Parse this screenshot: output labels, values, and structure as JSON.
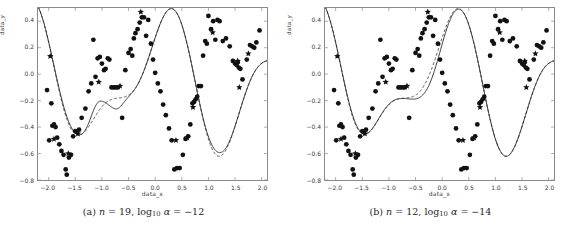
{
  "figure": {
    "background": "#ffffff",
    "marker_color": "#111111",
    "curve_color": "#333333"
  },
  "panels": [
    {
      "id": "a",
      "caption": {
        "tag": "(a)",
        "n_symbol": "n",
        "n_value": "= 19,",
        "log_base": "10",
        "log_symbol": "log",
        "alpha_symbol": "α",
        "alpha_value": "= −12",
        "full_text": "(a) n = 19, log10 α = −12"
      }
    },
    {
      "id": "b",
      "caption": {
        "tag": "(b)",
        "n_symbol": "n",
        "n_value": "= 12,",
        "log_base": "10",
        "log_symbol": "log",
        "alpha_symbol": "α",
        "alpha_value": "= −14",
        "full_text": "(b) n = 12, log10 α = −14"
      }
    }
  ],
  "chart_data": [
    {
      "type": "scatter",
      "panel": "a",
      "title": "",
      "xlabel": "data_x",
      "ylabel": "data_y",
      "xlim": [
        -2.2,
        2.1
      ],
      "ylim": [
        -0.8,
        0.5
      ],
      "xticks": [
        -2.0,
        -1.5,
        -1.0,
        -0.5,
        0.0,
        0.5,
        1.0,
        1.5,
        2.0
      ],
      "xticklabels": [
        "−2.0",
        "−1.5",
        "−1.0",
        "−0.5",
        "0.0",
        "0.5",
        "1.0",
        "1.5",
        "2.0"
      ],
      "yticks": [
        0.4,
        0.2,
        0.0,
        -0.2,
        -0.4,
        -0.6,
        -0.8
      ],
      "yticklabels": [
        "0.4",
        "0.2",
        "0.0",
        "−0.2",
        "−0.4",
        "−0.6",
        "−0.8"
      ],
      "grid": false,
      "legend": "none",
      "series": [
        {
          "name": "data points (circles)",
          "marker": "circle",
          "points": [
            [
              -2.03,
              -0.12
            ],
            [
              -1.99,
              -0.5
            ],
            [
              -1.95,
              -0.22
            ],
            [
              -1.93,
              -0.39
            ],
            [
              -1.9,
              -0.38
            ],
            [
              -1.87,
              -0.4
            ],
            [
              -1.84,
              -0.48
            ],
            [
              -1.8,
              -0.53
            ],
            [
              -1.76,
              -0.58
            ],
            [
              -1.72,
              -0.61
            ],
            [
              -1.68,
              -0.72
            ],
            [
              -1.66,
              -0.76
            ],
            [
              -1.62,
              -0.63
            ],
            [
              -1.58,
              -0.61
            ],
            [
              -1.54,
              -0.47
            ],
            [
              -1.5,
              -0.43
            ],
            [
              -1.47,
              -0.44
            ],
            [
              -1.43,
              -0.42
            ],
            [
              -1.38,
              -0.33
            ],
            [
              -1.31,
              -0.26
            ],
            [
              -1.25,
              -0.13
            ],
            [
              -1.2,
              -0.07
            ],
            [
              -1.16,
              0.26
            ],
            [
              -1.12,
              -0.02
            ],
            [
              -1.08,
              0.12
            ],
            [
              -1.04,
              0.13
            ],
            [
              -1.0,
              0.08
            ],
            [
              -0.96,
              0.03
            ],
            [
              -0.93,
              0.04
            ],
            [
              -0.89,
              0.12
            ],
            [
              -0.86,
              0.11
            ],
            [
              -0.82,
              -0.1
            ],
            [
              -0.78,
              -0.1
            ],
            [
              -0.74,
              -0.1
            ],
            [
              -0.7,
              -0.1
            ],
            [
              -0.62,
              -0.33
            ],
            [
              -0.56,
              0.03
            ],
            [
              -0.5,
              0.16
            ],
            [
              -0.46,
              0.19
            ],
            [
              -0.43,
              0.14
            ],
            [
              -0.4,
              0.27
            ],
            [
              -0.37,
              0.31
            ],
            [
              -0.33,
              0.34
            ],
            [
              -0.29,
              0.39
            ],
            [
              -0.25,
              0.43
            ],
            [
              -0.21,
              0.43
            ],
            [
              -0.17,
              0.29
            ],
            [
              -0.13,
              0.41
            ],
            [
              -0.08,
              0.23
            ],
            [
              -0.04,
              0.11
            ],
            [
              0.0,
              0.01
            ],
            [
              0.05,
              -0.07
            ],
            [
              0.1,
              -0.13
            ],
            [
              0.15,
              -0.23
            ],
            [
              0.2,
              -0.31
            ],
            [
              0.26,
              -0.41
            ],
            [
              0.31,
              -0.5
            ],
            [
              0.36,
              -0.72
            ],
            [
              0.41,
              -0.71
            ],
            [
              0.46,
              -0.71
            ],
            [
              0.52,
              -0.61
            ],
            [
              0.57,
              -0.49
            ],
            [
              0.62,
              -0.47
            ],
            [
              0.66,
              -0.38
            ],
            [
              0.7,
              -0.22
            ],
            [
              0.73,
              -0.21
            ],
            [
              0.76,
              -0.19
            ],
            [
              0.79,
              -0.17
            ],
            [
              0.82,
              -0.09
            ],
            [
              0.86,
              -0.09
            ],
            [
              0.9,
              0.14
            ],
            [
              0.94,
              0.25
            ],
            [
              0.97,
              0.23
            ],
            [
              1.0,
              0.44
            ],
            [
              1.05,
              0.34
            ],
            [
              1.09,
              0.4
            ],
            [
              1.13,
              0.26
            ],
            [
              1.17,
              0.41
            ],
            [
              1.21,
              0.4
            ],
            [
              1.27,
              0.25
            ],
            [
              1.33,
              0.27
            ],
            [
              1.4,
              0.21
            ],
            [
              1.46,
              0.1
            ],
            [
              1.5,
              0.08
            ],
            [
              1.53,
              0.07
            ],
            [
              1.55,
              0.09
            ],
            [
              1.57,
              0.05
            ],
            [
              1.6,
              0.04
            ],
            [
              1.64,
              -0.04
            ],
            [
              1.72,
              0.11
            ],
            [
              1.78,
              0.22
            ],
            [
              1.82,
              0.21
            ],
            [
              1.86,
              0.2
            ],
            [
              1.9,
              0.24
            ],
            [
              1.96,
              0.33
            ]
          ]
        },
        {
          "name": "outlier points (stars)",
          "marker": "star",
          "points": [
            [
              -1.97,
              0.135
            ],
            [
              -1.9,
              -0.49
            ],
            [
              -1.63,
              -0.6
            ],
            [
              -1.45,
              -0.45
            ],
            [
              -1.06,
              -0.06
            ],
            [
              -0.66,
              -0.09
            ],
            [
              -0.27,
              0.47
            ],
            [
              0.39,
              -0.5
            ],
            [
              0.6,
              -0.48
            ],
            [
              0.71,
              -0.25
            ],
            [
              1.08,
              0.315
            ],
            [
              1.55,
              0.1
            ],
            [
              1.58,
              -0.1
            ],
            [
              1.75,
              0.155
            ]
          ]
        },
        {
          "name": "fit-solid",
          "style": "solid",
          "description": "polynomial fit n=19 with extra oscillation near x=-1.1 and x=-0.6"
        },
        {
          "name": "fit-dashed",
          "style": "dashed",
          "description": "smoother reference fit"
        }
      ]
    },
    {
      "type": "scatter",
      "panel": "b",
      "title": "",
      "xlabel": "data_x",
      "ylabel": "data_y",
      "xlim": [
        -2.2,
        2.1
      ],
      "ylim": [
        -0.8,
        0.5
      ],
      "xticks": [
        -2.0,
        -1.5,
        -1.0,
        -0.5,
        0.0,
        0.5,
        1.0,
        1.5,
        2.0
      ],
      "xticklabels": [
        "−2.0",
        "−1.5",
        "−1.0",
        "−0.5",
        "0.0",
        "0.5",
        "1.0",
        "1.5",
        "2.0"
      ],
      "yticks": [
        0.4,
        0.2,
        0.0,
        -0.2,
        -0.4,
        -0.6,
        -0.8
      ],
      "yticklabels": [
        "0.4",
        "0.2",
        "0.0",
        "−0.2",
        "−0.4",
        "−0.6",
        "−0.8"
      ],
      "grid": false,
      "legend": "none",
      "series": [
        {
          "name": "data points (circles)",
          "marker": "circle",
          "points": [
            [
              -2.03,
              -0.12
            ],
            [
              -1.99,
              -0.5
            ],
            [
              -1.95,
              -0.22
            ],
            [
              -1.93,
              -0.39
            ],
            [
              -1.9,
              -0.38
            ],
            [
              -1.87,
              -0.4
            ],
            [
              -1.84,
              -0.48
            ],
            [
              -1.8,
              -0.53
            ],
            [
              -1.76,
              -0.58
            ],
            [
              -1.72,
              -0.61
            ],
            [
              -1.68,
              -0.72
            ],
            [
              -1.66,
              -0.76
            ],
            [
              -1.62,
              -0.63
            ],
            [
              -1.58,
              -0.61
            ],
            [
              -1.54,
              -0.47
            ],
            [
              -1.5,
              -0.43
            ],
            [
              -1.47,
              -0.44
            ],
            [
              -1.43,
              -0.42
            ],
            [
              -1.38,
              -0.33
            ],
            [
              -1.31,
              -0.26
            ],
            [
              -1.25,
              -0.13
            ],
            [
              -1.2,
              -0.07
            ],
            [
              -1.16,
              0.26
            ],
            [
              -1.12,
              -0.02
            ],
            [
              -1.08,
              0.12
            ],
            [
              -1.04,
              0.13
            ],
            [
              -1.0,
              0.08
            ],
            [
              -0.96,
              0.03
            ],
            [
              -0.93,
              0.04
            ],
            [
              -0.89,
              0.12
            ],
            [
              -0.86,
              0.11
            ],
            [
              -0.82,
              -0.1
            ],
            [
              -0.78,
              -0.1
            ],
            [
              -0.74,
              -0.1
            ],
            [
              -0.7,
              -0.1
            ],
            [
              -0.62,
              -0.33
            ],
            [
              -0.56,
              0.03
            ],
            [
              -0.5,
              0.16
            ],
            [
              -0.46,
              0.19
            ],
            [
              -0.43,
              0.14
            ],
            [
              -0.4,
              0.27
            ],
            [
              -0.37,
              0.31
            ],
            [
              -0.33,
              0.34
            ],
            [
              -0.29,
              0.39
            ],
            [
              -0.25,
              0.43
            ],
            [
              -0.21,
              0.43
            ],
            [
              -0.17,
              0.29
            ],
            [
              -0.13,
              0.41
            ],
            [
              -0.08,
              0.23
            ],
            [
              -0.04,
              0.11
            ],
            [
              0.0,
              0.01
            ],
            [
              0.05,
              -0.07
            ],
            [
              0.1,
              -0.13
            ],
            [
              0.15,
              -0.23
            ],
            [
              0.2,
              -0.31
            ],
            [
              0.26,
              -0.41
            ],
            [
              0.31,
              -0.5
            ],
            [
              0.36,
              -0.72
            ],
            [
              0.41,
              -0.71
            ],
            [
              0.46,
              -0.71
            ],
            [
              0.52,
              -0.61
            ],
            [
              0.57,
              -0.49
            ],
            [
              0.62,
              -0.47
            ],
            [
              0.66,
              -0.38
            ],
            [
              0.7,
              -0.22
            ],
            [
              0.73,
              -0.21
            ],
            [
              0.76,
              -0.19
            ],
            [
              0.79,
              -0.17
            ],
            [
              0.82,
              -0.09
            ],
            [
              0.86,
              -0.09
            ],
            [
              0.9,
              0.14
            ],
            [
              0.94,
              0.25
            ],
            [
              0.97,
              0.23
            ],
            [
              1.0,
              0.44
            ],
            [
              1.05,
              0.34
            ],
            [
              1.09,
              0.4
            ],
            [
              1.13,
              0.26
            ],
            [
              1.17,
              0.41
            ],
            [
              1.21,
              0.4
            ],
            [
              1.27,
              0.25
            ],
            [
              1.33,
              0.27
            ],
            [
              1.4,
              0.21
            ],
            [
              1.46,
              0.1
            ],
            [
              1.5,
              0.08
            ],
            [
              1.53,
              0.07
            ],
            [
              1.55,
              0.09
            ],
            [
              1.57,
              0.05
            ],
            [
              1.6,
              0.04
            ],
            [
              1.64,
              -0.04
            ],
            [
              1.72,
              0.11
            ],
            [
              1.78,
              0.22
            ],
            [
              1.82,
              0.21
            ],
            [
              1.86,
              0.2
            ],
            [
              1.9,
              0.24
            ],
            [
              1.96,
              0.33
            ]
          ]
        },
        {
          "name": "outlier points (stars)",
          "marker": "star",
          "points": [
            [
              -1.97,
              0.135
            ],
            [
              -1.9,
              -0.49
            ],
            [
              -1.63,
              -0.6
            ],
            [
              -1.45,
              -0.45
            ],
            [
              -1.06,
              -0.06
            ],
            [
              -0.66,
              -0.09
            ],
            [
              -0.27,
              0.47
            ],
            [
              0.39,
              -0.5
            ],
            [
              0.6,
              -0.48
            ],
            [
              0.71,
              -0.25
            ],
            [
              1.08,
              0.315
            ],
            [
              1.55,
              0.1
            ],
            [
              1.58,
              -0.1
            ],
            [
              1.75,
              0.155
            ]
          ]
        },
        {
          "name": "fit-solid",
          "style": "solid",
          "description": "polynomial fit n=12, lower peak near x=-0.2"
        },
        {
          "name": "fit-dashed",
          "style": "dashed",
          "description": "reference fit with higher peak near x=-0.2"
        }
      ]
    }
  ]
}
